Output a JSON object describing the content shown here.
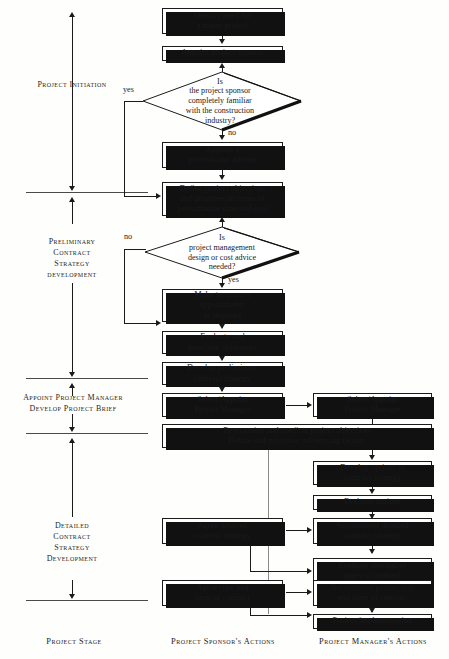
{
  "figure": {
    "type": "flowchart",
    "columns": [
      {
        "id": "stage",
        "header": "Project Stage"
      },
      {
        "id": "sponsor",
        "header": "Project Sponsor's Actions"
      },
      {
        "id": "manager",
        "header": "Project Manager's Actions"
      }
    ],
    "stages": [
      {
        "id": "stage-initiation",
        "lines": [
          "Project Initiation"
        ]
      },
      {
        "id": "stage-preliminary",
        "lines": [
          "Preliminary",
          "Contract",
          "Strategy",
          "development"
        ]
      },
      {
        "id": "stage-appoint",
        "lines": [
          "Appoint Project Manager",
          "Develop Project Brief"
        ]
      },
      {
        "id": "stage-detailed",
        "lines": [
          "Detailed",
          "Contract",
          "Strategy",
          "Development"
        ]
      }
    ],
    "sponsor_nodes": [
      {
        "id": "identify-need",
        "lines": [
          "Identify need for",
          "a major project"
        ]
      },
      {
        "id": "appoint-sponsor",
        "lines": [
          "Appoint project sponsor"
        ]
      },
      {
        "id": "appoint-adviser",
        "lines": [
          "Appoint a",
          "professional adviser"
        ]
      },
      {
        "id": "define-objectives",
        "lines": [
          "Define project objectives",
          "and priorities in terms of",
          "performance time and cost"
        ]
      },
      {
        "id": "temporary-appointments",
        "lines": [
          "Make temporary",
          "appointments",
          "as required"
        ]
      },
      {
        "id": "evaluate-prioritise",
        "lines": [
          "Evaluate and",
          "prioritise objectives"
        ]
      },
      {
        "id": "develop-preliminary",
        "lines": [
          "Develop preliminary",
          "contract strategy"
        ]
      },
      {
        "id": "select-appoint-pm-sponsor",
        "lines": [
          "Select/Appoint",
          "Project Manager"
        ]
      },
      {
        "id": "re-examine",
        "lines": [
          "Re-examine and confirm project objectives",
          "Define and prioritise influencing factors"
        ]
      },
      {
        "id": "agree-detailed",
        "lines": [
          "Agree detailed",
          "contract strategy"
        ]
      },
      {
        "id": "agree-type-form",
        "lines": [
          "Agree type and",
          "form of contract"
        ]
      }
    ],
    "decisions": [
      {
        "id": "sponsor-familiar",
        "lines": [
          "Is",
          "the project sponsor",
          "completely familiar",
          "with the construction",
          "industry?"
        ],
        "yes_label": "yes",
        "no_label": "no"
      },
      {
        "id": "advice-needed",
        "lines": [
          "Is",
          "project management",
          "design or cost advice",
          "needed?"
        ],
        "yes_label": "yes",
        "no_label": "no"
      }
    ],
    "manager_nodes": [
      {
        "id": "select-appoint-pm-manager",
        "lines": [
          "Select/Appoint",
          "Project Manager"
        ]
      },
      {
        "id": "develop-options",
        "lines": [
          "Develop options to",
          "contract strategy"
        ]
      },
      {
        "id": "evaluate-options",
        "lines": [
          "Evaluate options"
        ]
      },
      {
        "id": "recommend-detailed",
        "lines": [
          "Recommend detailed",
          "contract strategy"
        ]
      },
      {
        "id": "evaluate-alternative",
        "lines": [
          "Evaluate alternative",
          "types of contract"
        ]
      },
      {
        "id": "recommend-partnership",
        "lines": [
          "Recommend partnership",
          "and form of contract"
        ]
      },
      {
        "id": "project-implementation",
        "lines": [
          "Project implementation"
        ]
      }
    ]
  }
}
